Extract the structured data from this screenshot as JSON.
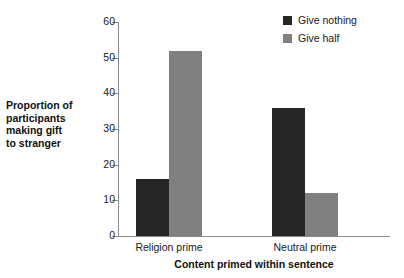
{
  "chart_data": {
    "type": "bar",
    "title": "",
    "subtitle": "",
    "xlabel": "Content primed within sentence",
    "ylabel": "Proportion of participants making gift to stranger",
    "ylabel_lines": [
      "Proportion of",
      "participants",
      "making gift",
      "to stranger"
    ],
    "categories": [
      "Religion prime",
      "Neutral prime"
    ],
    "series": [
      {
        "name": "Give nothing",
        "color": "#262626",
        "values": [
          16,
          52
        ]
      },
      {
        "name": "Give half",
        "color": "#808080",
        "values": [
          52,
          12
        ]
      }
    ],
    "series_fixed": [
      {
        "name": "Give nothing",
        "color": "#262626",
        "values": [
          16,
          36
        ]
      },
      {
        "name": "Give half",
        "color": "#808080",
        "values": [
          52,
          12
        ]
      }
    ],
    "ylim": [
      0,
      60
    ],
    "ytick_values": [
      0,
      10,
      20,
      30,
      40,
      50,
      60
    ],
    "ytick_labels": [
      "0",
      "10",
      "20",
      "30",
      "40",
      "50",
      "60"
    ],
    "grid": false,
    "legend_position": "top-right",
    "axis_color": "#8c8c8c"
  },
  "legend": {
    "items": [
      {
        "label": "Give nothing",
        "color": "#262626"
      },
      {
        "label": "Give half",
        "color": "#808080"
      }
    ]
  },
  "axes": {
    "x_title": "Content primed within sentence",
    "y_title_lines": [
      "Proportion of",
      "participants",
      "making gift",
      "to stranger"
    ],
    "x_categories": [
      "Religion prime",
      "Neutral prime"
    ],
    "y_ticks": [
      "0",
      "10",
      "20",
      "30",
      "40",
      "50",
      "60"
    ]
  }
}
